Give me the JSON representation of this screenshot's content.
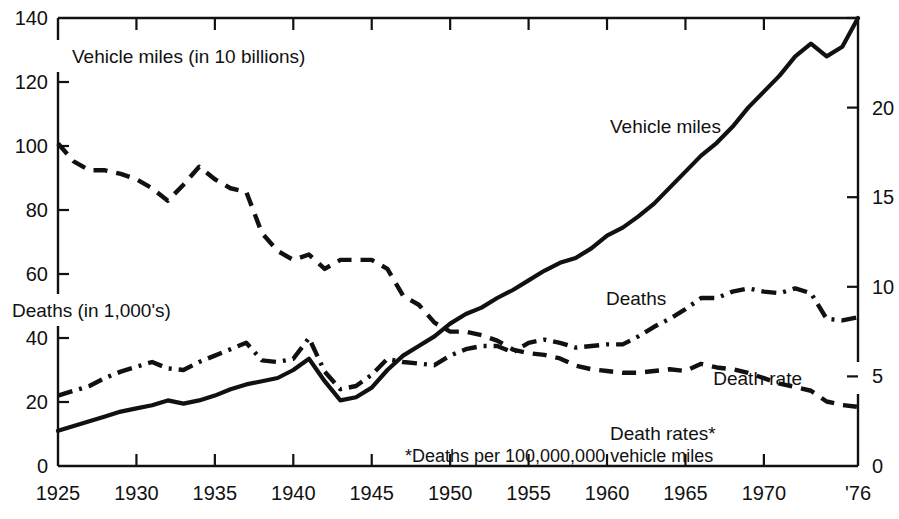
{
  "chart_data": {
    "type": "line",
    "title": "",
    "subtitle": "",
    "xlabel": "",
    "ylabel": "Vehicle miles (in 10 billions)",
    "y2label": "Death rate",
    "left_axis_captions": [
      "Vehicle miles (in 10 billions)",
      "Deaths (in 1,000's)"
    ],
    "right_axis_caption": "Death rate",
    "annotation": "*Deaths per 100,000,000 vehicle miles",
    "grid": false,
    "legend_position": "inline-labels",
    "xlim": [
      1925,
      1976
    ],
    "ylim": [
      0,
      140
    ],
    "y2lim": [
      0,
      25
    ],
    "xticks": [
      1925,
      1930,
      1935,
      1940,
      1945,
      1950,
      1955,
      1960,
      1965,
      1970,
      1976
    ],
    "xticklabels": [
      "1925",
      "1930",
      "1935",
      "1940",
      "1945",
      "1950",
      "1955",
      "1960",
      "1965",
      "1970",
      "'76"
    ],
    "yticks": [
      0,
      20,
      40,
      60,
      80,
      100,
      120,
      140
    ],
    "yticklabels": [
      "0",
      "20",
      "40",
      "60",
      "80",
      "100",
      "120",
      "140"
    ],
    "y2ticks": [
      0,
      5,
      10,
      15,
      20,
      25,
      30
    ],
    "y2ticklabels": [
      "0",
      "5",
      "10",
      "15",
      "20",
      "",
      ""
    ],
    "x": [
      1925,
      1926,
      1927,
      1928,
      1929,
      1930,
      1931,
      1932,
      1933,
      1934,
      1935,
      1936,
      1937,
      1938,
      1939,
      1940,
      1941,
      1942,
      1943,
      1944,
      1945,
      1946,
      1947,
      1948,
      1949,
      1950,
      1951,
      1952,
      1953,
      1954,
      1955,
      1956,
      1957,
      1958,
      1959,
      1960,
      1961,
      1962,
      1963,
      1964,
      1965,
      1966,
      1967,
      1968,
      1969,
      1970,
      1971,
      1972,
      1973,
      1974,
      1975,
      1976
    ],
    "series": [
      {
        "name": "Vehicle miles",
        "label": "Vehicle miles",
        "axis": "left",
        "style": "solid",
        "unit": "10 billions of vehicle miles",
        "values": [
          11.0,
          12.5,
          14.0,
          15.5,
          17.0,
          18.0,
          19.0,
          20.5,
          19.5,
          20.5,
          22.0,
          24.0,
          25.5,
          26.5,
          27.5,
          30.0,
          33.5,
          26.5,
          20.5,
          21.5,
          24.5,
          30.0,
          34.5,
          37.5,
          40.5,
          44.5,
          47.5,
          49.5,
          52.5,
          55.0,
          58.0,
          61.0,
          63.5,
          65.0,
          68.0,
          72.0,
          74.5,
          78.0,
          82.0,
          87.0,
          92.0,
          97.0,
          101.0,
          106.0,
          112.0,
          117.0,
          122.0,
          128.0,
          132.0,
          128.0,
          131.0,
          140.0
        ]
      },
      {
        "name": "Deaths",
        "label": "Deaths",
        "axis": "left",
        "style": "dash-dot",
        "unit": "thousands of deaths",
        "values": [
          22.0,
          23.5,
          25.0,
          27.5,
          29.5,
          31.0,
          32.5,
          30.5,
          30.0,
          32.5,
          34.5,
          36.5,
          38.5,
          33.0,
          32.5,
          33.5,
          40.0,
          29.5,
          24.0,
          25.0,
          28.5,
          33.5,
          32.5,
          32.0,
          31.5,
          34.5,
          36.5,
          37.5,
          37.5,
          35.5,
          38.5,
          39.5,
          38.5,
          37.0,
          37.5,
          38.0,
          38.0,
          40.5,
          43.5,
          46.0,
          49.0,
          52.5,
          52.5,
          54.5,
          55.5,
          54.5,
          54.0,
          55.5,
          54.0,
          46.0,
          45.5,
          46.5
        ]
      },
      {
        "name": "Death rates",
        "label": "Death rates*",
        "axis": "right",
        "style": "dashed",
        "unit": "deaths per 100,000,000 vehicle miles",
        "values": [
          18.0,
          17.0,
          16.5,
          16.5,
          16.3,
          16.0,
          15.5,
          14.8,
          15.7,
          16.7,
          16.0,
          15.5,
          15.3,
          13.0,
          12.0,
          11.5,
          11.8,
          11.0,
          11.5,
          11.5,
          11.5,
          11.0,
          9.5,
          9.0,
          8.0,
          7.5,
          7.5,
          7.3,
          7.0,
          6.5,
          6.3,
          6.2,
          6.0,
          5.6,
          5.4,
          5.3,
          5.2,
          5.2,
          5.3,
          5.4,
          5.3,
          5.7,
          5.5,
          5.4,
          5.2,
          4.9,
          4.6,
          4.4,
          4.2,
          3.6,
          3.4,
          3.3
        ]
      }
    ]
  }
}
